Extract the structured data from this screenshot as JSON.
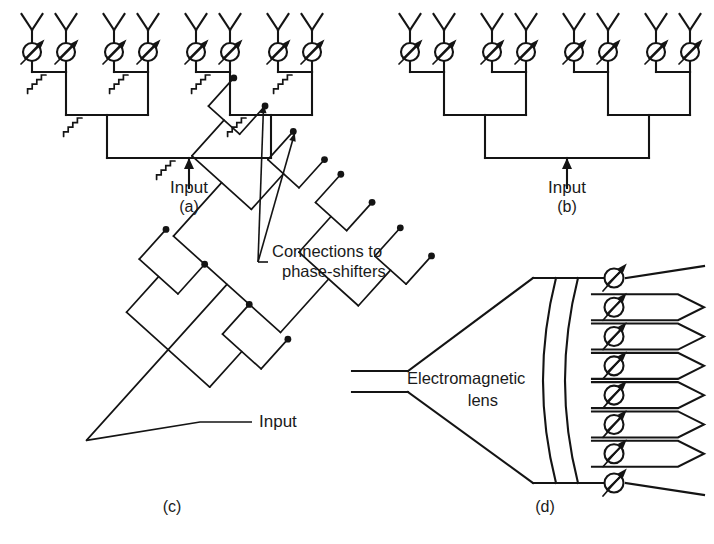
{
  "figure": {
    "background_color": "#ffffff",
    "line_color": "#141414",
    "text_color": "#1a1a1a"
  },
  "panels": [
    {
      "id": "a",
      "label": "(a)",
      "label_x": 178,
      "label_y": 212,
      "description": "Corporate (constrained) feed with matched power dividers and isolation resistors, eight radiating elements with variable phase-shifters",
      "element_count": 8,
      "stage_count": 3,
      "has_isolation_resistors": true,
      "resistor_count": 7,
      "input_label": "Input",
      "input_label_x": 172,
      "input_label_y": 193,
      "origin_x": 18,
      "origin_y": 8
    },
    {
      "id": "b",
      "label": "(b)",
      "label_x": 523,
      "label_y": 212,
      "description": "Corporate feed without isolation resistors, eight radiating elements with variable phase-shifters",
      "element_count": 8,
      "stage_count": 3,
      "has_isolation_resistors": false,
      "resistor_count": 0,
      "input_label": "Input",
      "input_label_x": 516,
      "input_label_y": 193,
      "origin_x": 396,
      "origin_y": 8
    },
    {
      "id": "c",
      "label": "(c)",
      "label_x": 172,
      "label_y": 512,
      "description": "Planar corporate feed network drawn at an angle, sixteen output terminals shown as dots",
      "terminal_count": 16,
      "callout_label": "Connections to phase-shifters",
      "callout_line_1": "Connections to",
      "callout_line_2": "phase-shifters",
      "callout_x": 272,
      "callout_y_1": 257,
      "callout_y_2": 277,
      "input_label": "Input",
      "input_label_x": 259,
      "input_label_y": 427
    },
    {
      "id": "d",
      "label": "(d)",
      "label_x": 545,
      "label_y": 512,
      "description": "Space feed using an electromagnetic lens illuminating eight phase-shifters feeding horn elements",
      "lens_label_line_1": "Electromagnetic",
      "lens_label_line_2": "lens",
      "lens_label_x_1": 407,
      "lens_label_y_1": 384,
      "lens_label_x_2": 498,
      "lens_label_y_2": 406,
      "phase_shifter_count": 8,
      "horn_count": 6,
      "feed_type": "waveguide"
    }
  ],
  "symbols": {
    "antenna": "dipole-y-antenna",
    "phase_shifter": "variable-phase-shifter-circle",
    "resistor": "zigzag-isolation-resistor",
    "input_arrow": "input-arrowhead",
    "terminal": "terminal-dot",
    "lens": "electromagnetic-lens-arcs",
    "horn": "horn-radiator"
  }
}
